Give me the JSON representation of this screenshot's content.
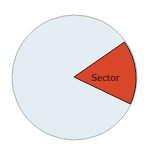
{
  "diagram": {
    "type": "circle-sector",
    "sector_label": "Sector",
    "colors": {
      "circle_fill": "#e4eef2",
      "circle_stroke": "#9aa3a8",
      "sector_fill": "#d9472a",
      "sector_stroke": "#3a1a12"
    }
  }
}
